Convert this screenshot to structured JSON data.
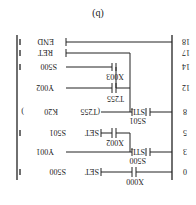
{
  "caption": "(b)",
  "rungs": [
    {
      "step": "0",
      "contacts": [
        "X000"
      ],
      "output": "SET",
      "operand": "S500"
    },
    {
      "step": "3",
      "contacts": [
        "S500 STL"
      ],
      "output": "",
      "operand": "Y001"
    },
    {
      "step": "5",
      "contacts": [
        "X002"
      ],
      "output": "SET",
      "operand": "S501"
    },
    {
      "step": "8",
      "contacts": [
        "S501 STL"
      ],
      "output": "T255",
      "operand": "K20"
    },
    {
      "step": "12",
      "contacts": [
        "T255"
      ],
      "output": "",
      "operand": "Y002"
    },
    {
      "step": "14",
      "contacts": [
        "X003"
      ],
      "output": "",
      "operand": "S500"
    },
    {
      "step": "17",
      "contacts": [],
      "output": "",
      "operand": "RET"
    },
    {
      "step": "18",
      "contacts": [],
      "output": "",
      "operand": "END"
    }
  ],
  "labels": {
    "s0": "0",
    "s3": "3",
    "s5": "5",
    "s8": "8",
    "s12": "12",
    "s14": "14",
    "s17": "17",
    "s18": "18",
    "x000": "X000",
    "s500c": "S500",
    "stl1": "STL",
    "x002": "X002",
    "s501c": "S501",
    "stl2": "STL",
    "t255c": "T255",
    "x003": "X003",
    "set1": "SET",
    "op_s500": "S500",
    "op_y001": "Y001",
    "set2": "SET",
    "op_s501": "S501",
    "t255o": "(T255",
    "k20": "K20",
    "op_y002": "Y002",
    "op_s500b": "S500",
    "op_ret": "RET",
    "op_end": "END"
  }
}
